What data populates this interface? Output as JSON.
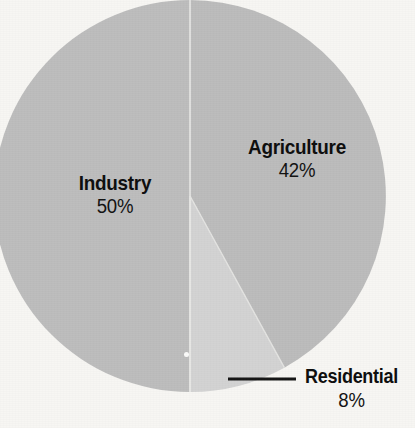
{
  "chart_data": {
    "type": "pie",
    "title": "",
    "subtitle": "",
    "xlabel": "",
    "ylabel": "",
    "legend_position": "none",
    "grid": false,
    "value_suffix": "%",
    "categories": [
      "Industry",
      "Agriculture",
      "Residential"
    ],
    "values": [
      50,
      42,
      8
    ],
    "slices": [
      {
        "name": "Industry",
        "value": 50,
        "value_label": "50%",
        "color": "#bdbdbd",
        "start_angle_deg": 180,
        "end_angle_deg": 360,
        "label_placement": "inside"
      },
      {
        "name": "Agriculture",
        "value": 42,
        "value_label": "42%",
        "color": "#bcbcbc",
        "start_angle_deg": 0,
        "end_angle_deg": 151.2,
        "label_placement": "inside"
      },
      {
        "name": "Residential",
        "value": 8,
        "value_label": "8%",
        "color": "#d3d3d3",
        "start_angle_deg": 151.2,
        "end_angle_deg": 180,
        "label_placement": "outside-leader"
      }
    ],
    "geometry": {
      "center_x": 190,
      "center_y": 196,
      "radius": 196,
      "divider_color": "#e8e8e6"
    },
    "colors": {
      "background": "#f7f6f3",
      "text": "#111111",
      "leader_line": "#151515",
      "industry": "#bdbdbd",
      "agriculture": "#bcbcbc",
      "residential": "#d3d3d3"
    },
    "leader_line": {
      "x1": 228,
      "y1": 379,
      "x2": 296,
      "y2": 379
    }
  },
  "labels": {
    "industry": {
      "name": "Industry",
      "value": "50%"
    },
    "agriculture": {
      "name": "Agriculture",
      "value": "42%"
    },
    "residential": {
      "name": "Residential",
      "value": "8%"
    }
  }
}
